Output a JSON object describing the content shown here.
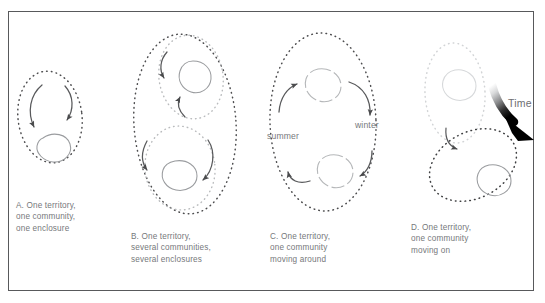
{
  "figure": {
    "background_color": "#ffffff",
    "frame_color": "#58595b",
    "text_color": "#76787b",
    "dot_color_dark": "#4d4d4f",
    "dot_color_light": "#b9bbbd",
    "circle_color": "#9a9c9f",
    "circle_color_faded": "#c8cacc",
    "arrow_color": "#58595b",
    "time_arrow_color": "#000000"
  },
  "panels": [
    {
      "id": "a",
      "letter": "A",
      "caption": "A. One territory,\none community,\none enclosure",
      "caption_lines": [
        "A. One territory,",
        "one community,",
        "one enclosure"
      ],
      "territories": 1,
      "communities": 1,
      "enclosures": 1,
      "arrows": 2
    },
    {
      "id": "b",
      "letter": "B",
      "caption": "B. One territory,\nseveral communities,\nseveral enclosures",
      "caption_lines": [
        "B. One territory,",
        "several communities,",
        "several enclosures"
      ],
      "territories": 1,
      "communities": 2,
      "enclosures": 2,
      "arrows": 4
    },
    {
      "id": "c",
      "letter": "C",
      "caption": "C. One territory,\none community\nmoving around",
      "caption_lines": [
        "C. One territory,",
        "one community",
        "moving around"
      ],
      "territories": 1,
      "communities": 1,
      "enclosures": 2,
      "arrows": 4,
      "season_labels": [
        "summer",
        "winter"
      ]
    },
    {
      "id": "d",
      "letter": "D",
      "caption": "D. One territory,\none community\nmoving on",
      "caption_lines": [
        "D. One territory,",
        "one community",
        "moving on"
      ],
      "territories": 2,
      "communities": 2,
      "enclosures": 2,
      "arrows": 1
    }
  ],
  "labels": {
    "summer": "summer",
    "winter": "winter",
    "time": "Time"
  }
}
